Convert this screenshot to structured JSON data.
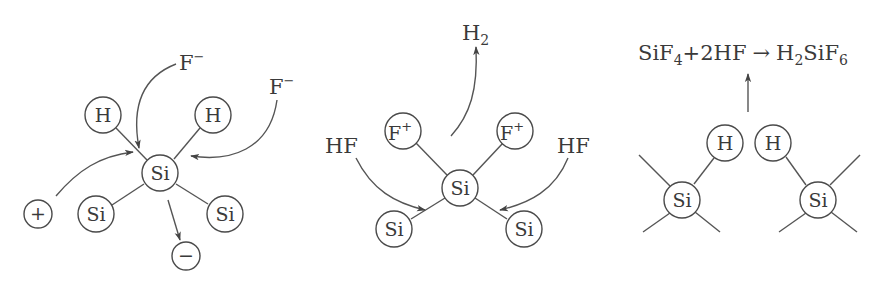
{
  "diagram": {
    "panels": [
      {
        "id": "panel-1",
        "center_atom": "Si",
        "bonded_atoms": [
          "H",
          "H",
          "Si",
          "Si"
        ],
        "charges": [
          "+",
          "−"
        ],
        "reagents": [
          "F⁻",
          "F⁻"
        ],
        "labels": {
          "si_center": "Si",
          "h_left": "H",
          "h_right": "H",
          "si_left": "Si",
          "si_right": "Si",
          "plus": "+",
          "minus": "−",
          "f_top": "F",
          "f_top_sup": "−",
          "f_right": "F",
          "f_right_sup": "−"
        }
      },
      {
        "id": "panel-2",
        "center_atom": "Si",
        "bonded_atoms": [
          "F⁺",
          "F⁺",
          "Si",
          "Si"
        ],
        "reagents": [
          "HF",
          "HF"
        ],
        "product": "H₂",
        "labels": {
          "si_center": "Si",
          "f_left": "F",
          "f_left_sup": "+",
          "f_right": "F",
          "f_right_sup": "+",
          "si_left": "Si",
          "si_right": "Si",
          "hf_left": "HF",
          "hf_right": "HF",
          "h2": "H",
          "h2_sub": "2"
        }
      },
      {
        "id": "panel-3",
        "atoms": [
          "Si",
          "H",
          "H",
          "Si"
        ],
        "equation": "SiF4 + 2HF → H2SiF6",
        "labels": {
          "si_left": "Si",
          "h_left": "H",
          "h_right": "H",
          "si_right": "Si",
          "eq_sif": "SiF",
          "eq_sub4": "4",
          "eq_plus_2hf": "+2HF",
          "eq_arrow": "→",
          "eq_h": "H",
          "eq_sub2": "2",
          "eq_sif2": "SiF",
          "eq_sub6": "6"
        }
      }
    ],
    "colors": {
      "stroke": "#4a4a4a",
      "text": "#3a3a3a",
      "background": "#ffffff"
    }
  }
}
